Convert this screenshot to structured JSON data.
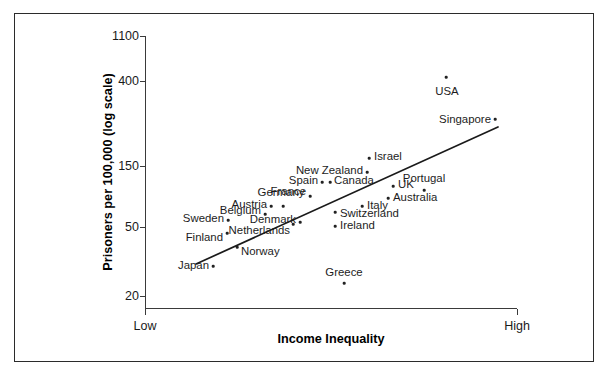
{
  "chart_data": {
    "type": "scatter",
    "title": "",
    "xlabel": "Income Inequality",
    "ylabel": "Prisoners per 100,000 (log scale)",
    "x_axis": {
      "low_label": "Low",
      "high_label": "High",
      "scale": "ordinal-range"
    },
    "y_axis": {
      "scale": "log",
      "ticks": [
        1100,
        400,
        150,
        50,
        20
      ],
      "tick_labels": [
        "1100",
        "400",
        "150",
        "50",
        "20"
      ],
      "ylim": [
        20,
        1100
      ]
    },
    "grid": false,
    "legend": null,
    "trend_line": {
      "present": true,
      "description": "positive linear fit from low-inequality/low-imprisonment to high-inequality/high-imprisonment",
      "x_start_px": 196,
      "y_start_px": 264,
      "x_end_px": 498,
      "y_end_px": 127
    },
    "points": [
      {
        "label": "USA",
        "x_px": 446,
        "y_px": 77,
        "value": 480,
        "label_x_px": 447,
        "label_y_px": 92,
        "anchor": "middle"
      },
      {
        "label": "Singapore",
        "x_px": 495,
        "y_px": 119,
        "value": 280,
        "label_x_px": 491,
        "label_y_px": 120,
        "anchor": "end"
      },
      {
        "label": "Israel",
        "x_px": 369,
        "y_px": 158,
        "value": 180,
        "label_x_px": 374,
        "label_y_px": 157,
        "anchor": "start"
      },
      {
        "label": "New Zealand",
        "x_px": 367,
        "y_px": 172,
        "value": 160,
        "label_x_px": 363,
        "label_y_px": 171,
        "anchor": "end"
      },
      {
        "label": "Spain",
        "x_px": 322,
        "y_px": 182,
        "value": 148,
        "label_x_px": 318,
        "label_y_px": 181,
        "anchor": "end"
      },
      {
        "label": "Canada",
        "x_px": 330,
        "y_px": 182,
        "value": 148,
        "label_x_px": 334,
        "label_y_px": 181,
        "anchor": "start"
      },
      {
        "label": "UK",
        "x_px": 393,
        "y_px": 186,
        "value": 142,
        "label_x_px": 398,
        "label_y_px": 185,
        "anchor": "start"
      },
      {
        "label": "Portugal",
        "x_px": 424,
        "y_px": 190,
        "value": 135,
        "label_x_px": 424,
        "label_y_px": 179,
        "anchor": "middle"
      },
      {
        "label": "France",
        "x_px": 310,
        "y_px": 196,
        "value": 125,
        "label_x_px": 306,
        "label_y_px": 192,
        "anchor": "end"
      },
      {
        "label": "Germany",
        "x_px": 283,
        "y_px": 206,
        "value": 110,
        "label_x_px": 281,
        "label_y_px": 193,
        "anchor": "middle"
      },
      {
        "label": "Austria",
        "x_px": 271,
        "y_px": 206,
        "value": 110,
        "label_x_px": 267,
        "label_y_px": 205,
        "anchor": "end"
      },
      {
        "label": "Australia",
        "x_px": 388,
        "y_px": 198,
        "value": 120,
        "label_x_px": 393,
        "label_y_px": 198,
        "anchor": "start"
      },
      {
        "label": "Italy",
        "x_px": 362,
        "y_px": 206,
        "value": 110,
        "label_x_px": 367,
        "label_y_px": 206,
        "anchor": "start"
      },
      {
        "label": "Switzerland",
        "x_px": 335,
        "y_px": 212,
        "value": 100,
        "label_x_px": 340,
        "label_y_px": 214,
        "anchor": "start"
      },
      {
        "label": "Belgium",
        "x_px": 265,
        "y_px": 214,
        "value": 98,
        "label_x_px": 261,
        "label_y_px": 211,
        "anchor": "end"
      },
      {
        "label": "Denmark",
        "x_px": 300,
        "y_px": 222,
        "value": 88,
        "label_x_px": 296,
        "label_y_px": 220,
        "anchor": "end"
      },
      {
        "label": "Sweden",
        "x_px": 228,
        "y_px": 220,
        "value": 90,
        "label_x_px": 224,
        "label_y_px": 219,
        "anchor": "end"
      },
      {
        "label": "Ireland",
        "x_px": 335,
        "y_px": 226,
        "value": 82,
        "label_x_px": 340,
        "label_y_px": 226,
        "anchor": "start"
      },
      {
        "label": "Netherlands",
        "x_px": 293,
        "y_px": 224,
        "value": 85,
        "label_x_px": 290,
        "label_y_px": 231,
        "anchor": "end"
      },
      {
        "label": "Finland",
        "x_px": 227,
        "y_px": 233,
        "value": 75,
        "label_x_px": 223,
        "label_y_px": 238,
        "anchor": "end"
      },
      {
        "label": "Norway",
        "x_px": 237,
        "y_px": 247,
        "value": 62,
        "label_x_px": 241,
        "label_y_px": 252,
        "anchor": "start"
      },
      {
        "label": "Japan",
        "x_px": 213,
        "y_px": 266,
        "value": 48,
        "label_x_px": 209,
        "label_y_px": 266,
        "anchor": "end"
      },
      {
        "label": "Greece",
        "x_px": 344,
        "y_px": 283,
        "value": 31,
        "label_x_px": 344,
        "label_y_px": 273,
        "anchor": "middle"
      }
    ]
  },
  "figure": {
    "y_tick_labels": [
      "1100",
      "400",
      "150",
      "50",
      "20"
    ],
    "x_low_label": "Low",
    "x_high_label": "High",
    "x_title": "Income Inequality",
    "y_title": "Prisoners per 100,000 (log scale)"
  }
}
